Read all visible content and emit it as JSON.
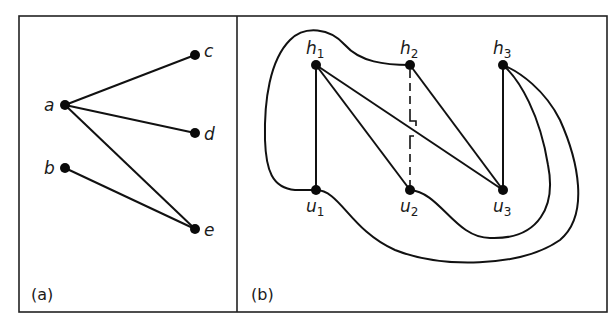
{
  "figure": {
    "panels": [
      {
        "id": "a",
        "label": "(a)",
        "nodes": [
          {
            "id": "a",
            "label": "a",
            "x": 65,
            "y": 105
          },
          {
            "id": "b",
            "label": "b",
            "x": 65,
            "y": 168
          },
          {
            "id": "c",
            "label": "c",
            "x": 195,
            "y": 55
          },
          {
            "id": "d",
            "label": "d",
            "x": 195,
            "y": 133
          },
          {
            "id": "e",
            "label": "e",
            "x": 195,
            "y": 229
          }
        ],
        "edges": [
          [
            "a",
            "c"
          ],
          [
            "a",
            "d"
          ],
          [
            "a",
            "e"
          ],
          [
            "b",
            "e"
          ]
        ]
      },
      {
        "id": "b",
        "label": "(b)",
        "nodes": [
          {
            "id": "h1",
            "label": "h",
            "sub": "1",
            "x": 316,
            "y": 65
          },
          {
            "id": "h2",
            "label": "h",
            "sub": "2",
            "x": 410,
            "y": 65
          },
          {
            "id": "h3",
            "label": "h",
            "sub": "3",
            "x": 503,
            "y": 65
          },
          {
            "id": "u1",
            "label": "u",
            "sub": "1",
            "x": 316,
            "y": 190
          },
          {
            "id": "u2",
            "label": "u",
            "sub": "2",
            "x": 410,
            "y": 190
          },
          {
            "id": "u3",
            "label": "u",
            "sub": "3",
            "x": 503,
            "y": 190
          }
        ],
        "straight_edges": [
          [
            "h1",
            "u1"
          ],
          [
            "h1",
            "u2"
          ],
          [
            "h1",
            "u3"
          ],
          [
            "h2",
            "u3"
          ],
          [
            "h3",
            "u3"
          ]
        ],
        "curved_edges": [
          [
            "h2",
            "u1"
          ],
          [
            "u2",
            "h3"
          ],
          [
            "u1",
            "h3"
          ]
        ],
        "dashed_edges": [
          [
            "h2",
            "u2"
          ]
        ]
      }
    ]
  }
}
